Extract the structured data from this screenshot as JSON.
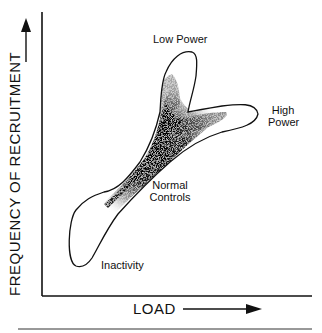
{
  "diagram": {
    "y_axis_label": "FREQUENCY OF RECRUITMENT",
    "x_axis_label": "LOAD",
    "regions": [
      {
        "name": "Low Power",
        "label": "Low Power"
      },
      {
        "name": "High Power",
        "label_line1": "High",
        "label_line2": "Power"
      },
      {
        "name": "Normal Controls",
        "label_line1": "Normal",
        "label_line2": "Controls"
      },
      {
        "name": "Inactivity",
        "label": "Inactivity"
      }
    ],
    "colors": {
      "ink": "#111111",
      "background": "#ffffff"
    }
  }
}
